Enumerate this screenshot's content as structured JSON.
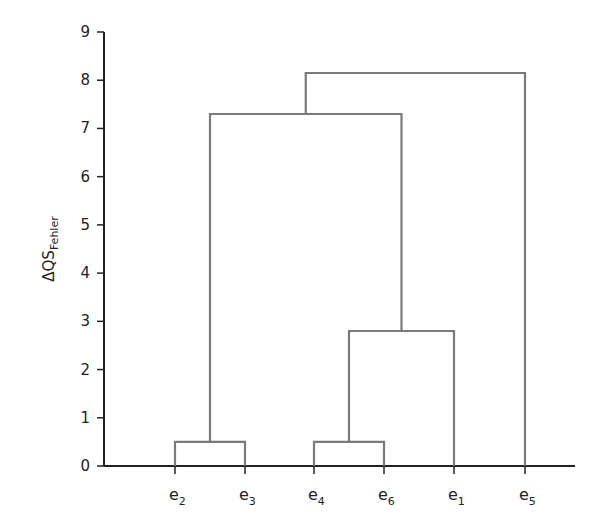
{
  "chart_data": {
    "type": "dendrogram",
    "title": "",
    "xlabel": "",
    "ylabel": "ΔQS",
    "ylabel_subscript": "Fehler",
    "ylim": [
      0,
      9
    ],
    "yticks": [
      0,
      1,
      2,
      3,
      4,
      5,
      6,
      7,
      8,
      9
    ],
    "grid": false,
    "leaves": [
      {
        "base": "e",
        "sub": "2"
      },
      {
        "base": "e",
        "sub": "3"
      },
      {
        "base": "e",
        "sub": "4"
      },
      {
        "base": "e",
        "sub": "6"
      },
      {
        "base": "e",
        "sub": "1"
      },
      {
        "base": "e",
        "sub": "5"
      }
    ],
    "merges": [
      {
        "left": "e2",
        "right": "e3",
        "height": 0.5
      },
      {
        "left": "e4",
        "right": "e6",
        "height": 0.5
      },
      {
        "left": "(e4,e6)",
        "right": "e1",
        "height": 2.8
      },
      {
        "left": "(e2,e3)",
        "right": "((e4,e6),e1)",
        "height": 7.3
      },
      {
        "left": "(e2,e3,e4,e6,e1)",
        "right": "e5",
        "height": 8.15
      }
    ],
    "line_color": "#7a7a7a",
    "axis_color": "#222222"
  }
}
